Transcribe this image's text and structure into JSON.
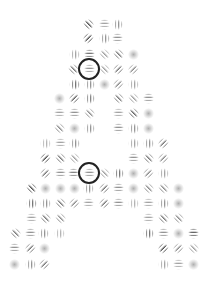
{
  "stimulus": {
    "description": "Gabor patch array forming the letter A with two circled target elements",
    "background": "#ffffff",
    "stripe_color": "#333333",
    "legend": {
      "h": "horizontal stripes",
      "v": "vertical stripes",
      "d": "diagonal stripes (top-left to bottom-right)",
      "a": "anti-diagonal stripes (bottom-left to top-right)",
      "b": "blurred blob"
    },
    "patches": [
      {
        "x": 88,
        "y": 24,
        "o": "d",
        "c": 0.9
      },
      {
        "x": 104,
        "y": 24,
        "o": "h",
        "c": 0.6
      },
      {
        "x": 117,
        "y": 24,
        "o": "v",
        "c": 0.7
      },
      {
        "x": 88,
        "y": 38,
        "o": "a",
        "c": 0.9
      },
      {
        "x": 104,
        "y": 38,
        "o": "v",
        "c": 0.7
      },
      {
        "x": 117,
        "y": 38,
        "o": "h",
        "c": 0.7
      },
      {
        "x": 74,
        "y": 54,
        "o": "v",
        "c": 0.6
      },
      {
        "x": 89,
        "y": 54,
        "o": "h",
        "c": 0.9
      },
      {
        "x": 104,
        "y": 54,
        "o": "d",
        "c": 0.5
      },
      {
        "x": 118,
        "y": 54,
        "o": "d",
        "c": 0.7
      },
      {
        "x": 133,
        "y": 54,
        "o": "b",
        "c": 0.5
      },
      {
        "x": 73,
        "y": 69,
        "o": "d",
        "c": 0.7
      },
      {
        "x": 89,
        "y": 69,
        "o": "h",
        "c": 0.7
      },
      {
        "x": 104,
        "y": 69,
        "o": "d",
        "c": 0.5
      },
      {
        "x": 118,
        "y": 69,
        "o": "a",
        "c": 0.7
      },
      {
        "x": 133,
        "y": 69,
        "o": "a",
        "c": 0.6
      },
      {
        "x": 74,
        "y": 84,
        "o": "v",
        "c": 0.9
      },
      {
        "x": 89,
        "y": 84,
        "o": "v",
        "c": 0.7
      },
      {
        "x": 104,
        "y": 84,
        "o": "b",
        "c": 0.5
      },
      {
        "x": 118,
        "y": 84,
        "o": "a",
        "c": 0.6
      },
      {
        "x": 133,
        "y": 84,
        "o": "v",
        "c": 0.6
      },
      {
        "x": 59,
        "y": 98,
        "o": "b",
        "c": 0.5
      },
      {
        "x": 74,
        "y": 98,
        "o": "a",
        "c": 0.8
      },
      {
        "x": 89,
        "y": 98,
        "o": "v",
        "c": 0.8
      },
      {
        "x": 118,
        "y": 98,
        "o": "d",
        "c": 0.7
      },
      {
        "x": 133,
        "y": 98,
        "o": "d",
        "c": 0.5
      },
      {
        "x": 148,
        "y": 98,
        "o": "h",
        "c": 0.7
      },
      {
        "x": 59,
        "y": 113,
        "o": "h",
        "c": 0.6
      },
      {
        "x": 74,
        "y": 113,
        "o": "h",
        "c": 0.7
      },
      {
        "x": 89,
        "y": 113,
        "o": "d",
        "c": 0.6
      },
      {
        "x": 118,
        "y": 113,
        "o": "h",
        "c": 0.6
      },
      {
        "x": 133,
        "y": 113,
        "o": "d",
        "c": 0.8
      },
      {
        "x": 148,
        "y": 113,
        "o": "b",
        "c": 0.5
      },
      {
        "x": 59,
        "y": 128,
        "o": "d",
        "c": 0.6
      },
      {
        "x": 74,
        "y": 128,
        "o": "b",
        "c": 0.5
      },
      {
        "x": 89,
        "y": 128,
        "o": "v",
        "c": 0.7
      },
      {
        "x": 118,
        "y": 128,
        "o": "h",
        "c": 0.7
      },
      {
        "x": 133,
        "y": 128,
        "o": "v",
        "c": 0.7
      },
      {
        "x": 148,
        "y": 128,
        "o": "b",
        "c": 0.5
      },
      {
        "x": 45,
        "y": 143,
        "o": "v",
        "c": 0.5
      },
      {
        "x": 60,
        "y": 143,
        "o": "h",
        "c": 0.6
      },
      {
        "x": 74,
        "y": 143,
        "o": "v",
        "c": 0.7
      },
      {
        "x": 133,
        "y": 143,
        "o": "v",
        "c": 0.6
      },
      {
        "x": 148,
        "y": 143,
        "o": "v",
        "c": 0.7
      },
      {
        "x": 163,
        "y": 143,
        "o": "a",
        "c": 0.7
      },
      {
        "x": 45,
        "y": 158,
        "o": "a",
        "c": 0.9
      },
      {
        "x": 60,
        "y": 158,
        "o": "d",
        "c": 0.7
      },
      {
        "x": 74,
        "y": 158,
        "o": "d",
        "c": 0.5
      },
      {
        "x": 133,
        "y": 158,
        "o": "h",
        "c": 0.7
      },
      {
        "x": 148,
        "y": 158,
        "o": "d",
        "c": 0.7
      },
      {
        "x": 163,
        "y": 158,
        "o": "a",
        "c": 0.6
      },
      {
        "x": 45,
        "y": 173,
        "o": "a",
        "c": 0.7
      },
      {
        "x": 60,
        "y": 173,
        "o": "h",
        "c": 0.7
      },
      {
        "x": 73,
        "y": 173,
        "o": "h",
        "c": 0.8
      },
      {
        "x": 89,
        "y": 173,
        "o": "h",
        "c": 0.7
      },
      {
        "x": 104,
        "y": 173,
        "o": "d",
        "c": 0.5
      },
      {
        "x": 118,
        "y": 173,
        "o": "v",
        "c": 0.9
      },
      {
        "x": 133,
        "y": 173,
        "o": "b",
        "c": 0.5
      },
      {
        "x": 148,
        "y": 173,
        "o": "a",
        "c": 0.6
      },
      {
        "x": 163,
        "y": 173,
        "o": "v",
        "c": 0.6
      },
      {
        "x": 31,
        "y": 188,
        "o": "d",
        "c": 0.9
      },
      {
        "x": 45,
        "y": 188,
        "o": "b",
        "c": 0.5
      },
      {
        "x": 60,
        "y": 188,
        "o": "b",
        "c": 0.5
      },
      {
        "x": 74,
        "y": 188,
        "o": "b",
        "c": 0.5
      },
      {
        "x": 88,
        "y": 188,
        "o": "v",
        "c": 0.7
      },
      {
        "x": 104,
        "y": 188,
        "o": "a",
        "c": 0.7
      },
      {
        "x": 118,
        "y": 188,
        "o": "h",
        "c": 0.7
      },
      {
        "x": 133,
        "y": 188,
        "o": "b",
        "c": 0.5
      },
      {
        "x": 148,
        "y": 188,
        "o": "d",
        "c": 0.6
      },
      {
        "x": 163,
        "y": 188,
        "o": "d",
        "c": 0.6
      },
      {
        "x": 178,
        "y": 188,
        "o": "b",
        "c": 0.5
      },
      {
        "x": 31,
        "y": 203,
        "o": "v",
        "c": 0.9
      },
      {
        "x": 45,
        "y": 203,
        "o": "v",
        "c": 0.7
      },
      {
        "x": 60,
        "y": 203,
        "o": "d",
        "c": 0.7
      },
      {
        "x": 74,
        "y": 203,
        "o": "a",
        "c": 0.6
      },
      {
        "x": 88,
        "y": 203,
        "o": "h",
        "c": 0.6
      },
      {
        "x": 104,
        "y": 203,
        "o": "a",
        "c": 0.7
      },
      {
        "x": 118,
        "y": 203,
        "o": "h",
        "c": 0.7
      },
      {
        "x": 133,
        "y": 203,
        "o": "v",
        "c": 0.5
      },
      {
        "x": 148,
        "y": 203,
        "o": "h",
        "c": 0.6
      },
      {
        "x": 163,
        "y": 203,
        "o": "v",
        "c": 0.7
      },
      {
        "x": 178,
        "y": 203,
        "o": "b",
        "c": 0.5
      },
      {
        "x": 31,
        "y": 218,
        "o": "h",
        "c": 0.6
      },
      {
        "x": 45,
        "y": 218,
        "o": "d",
        "c": 0.7
      },
      {
        "x": 60,
        "y": 218,
        "o": "d",
        "c": 0.6
      },
      {
        "x": 148,
        "y": 218,
        "o": "h",
        "c": 0.6
      },
      {
        "x": 163,
        "y": 218,
        "o": "d",
        "c": 0.7
      },
      {
        "x": 178,
        "y": 218,
        "o": "d",
        "c": 0.6
      },
      {
        "x": 15,
        "y": 233,
        "o": "d",
        "c": 0.7
      },
      {
        "x": 30,
        "y": 233,
        "o": "h",
        "c": 0.7
      },
      {
        "x": 43,
        "y": 233,
        "o": "v",
        "c": 0.7
      },
      {
        "x": 59,
        "y": 233,
        "o": "v",
        "c": 0.5
      },
      {
        "x": 148,
        "y": 233,
        "o": "v",
        "c": 0.9
      },
      {
        "x": 163,
        "y": 233,
        "o": "h",
        "c": 0.7
      },
      {
        "x": 178,
        "y": 233,
        "o": "b",
        "c": 0.5
      },
      {
        "x": 193,
        "y": 233,
        "o": "h",
        "c": 1.0
      },
      {
        "x": 14,
        "y": 248,
        "o": "h",
        "c": 0.7
      },
      {
        "x": 30,
        "y": 248,
        "o": "a",
        "c": 0.7
      },
      {
        "x": 44,
        "y": 248,
        "o": "b",
        "c": 0.5
      },
      {
        "x": 163,
        "y": 248,
        "o": "a",
        "c": 0.9
      },
      {
        "x": 178,
        "y": 248,
        "o": "a",
        "c": 0.6
      },
      {
        "x": 193,
        "y": 248,
        "o": "d",
        "c": 0.5
      },
      {
        "x": 14,
        "y": 264,
        "o": "b",
        "c": 0.5
      },
      {
        "x": 30,
        "y": 264,
        "o": "v",
        "c": 0.7
      },
      {
        "x": 44,
        "y": 264,
        "o": "a",
        "c": 0.7
      },
      {
        "x": 163,
        "y": 264,
        "o": "v",
        "c": 0.6
      },
      {
        "x": 178,
        "y": 264,
        "o": "h",
        "c": 0.6
      },
      {
        "x": 193,
        "y": 264,
        "o": "b",
        "c": 0.5
      }
    ],
    "targets": [
      {
        "x": 89,
        "y": 69,
        "r": 11,
        "color": "#222222"
      },
      {
        "x": 89,
        "y": 173,
        "r": 11,
        "color": "#222222"
      }
    ]
  }
}
